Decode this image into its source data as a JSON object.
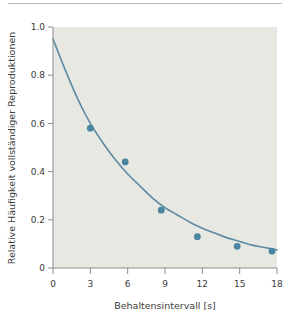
{
  "figure": {
    "name": "forgetting-curve-figure",
    "background_color": "#ffffff",
    "plot_background_color": "#e8e8e3",
    "accent_color": "#4a85a0",
    "curve_color": "#5c8ba3",
    "axis_color": "#8d8d8d",
    "text_color": "#3b3b3b"
  },
  "chart_data": {
    "type": "scatter",
    "title": "",
    "subtitle": "",
    "xlabel": "Behaltensintervall [s]",
    "ylabel": "Relative Häufigkeit vollständiger Reproduktionen",
    "xlim": [
      0,
      18
    ],
    "ylim": [
      0,
      1.0
    ],
    "xticks": [
      0,
      3,
      6,
      9,
      12,
      15,
      18
    ],
    "xtick_labels": [
      "0",
      "3",
      "6",
      "9",
      "12",
      "15",
      "18"
    ],
    "yticks": [
      0,
      0.2,
      0.4,
      0.6,
      0.8,
      1.0
    ],
    "ytick_labels": [
      "0",
      "0.2",
      "0.4",
      "0.6",
      "0.8",
      "1.0"
    ],
    "grid": false,
    "legend": null,
    "legend_position": "none",
    "series": [
      {
        "name": "Relative Häufigkeit vollständiger Reproduktionen",
        "marker": "circle",
        "marker_color": "#4a85a0",
        "x": [
          3,
          5.8,
          8.7,
          11.6,
          14.8,
          17.6
        ],
        "values": [
          0.58,
          0.44,
          0.24,
          0.13,
          0.09,
          0.07
        ]
      },
      {
        "name": "Fit-Kurve",
        "type": "line",
        "line_color": "#5c8ba3",
        "x": [
          0,
          1,
          2,
          3,
          4,
          5,
          6,
          7,
          8,
          9,
          10,
          11,
          12,
          13,
          14,
          15,
          16,
          17,
          18
        ],
        "values": [
          0.95,
          0.82,
          0.7,
          0.6,
          0.52,
          0.45,
          0.39,
          0.34,
          0.29,
          0.25,
          0.22,
          0.19,
          0.165,
          0.145,
          0.125,
          0.11,
          0.095,
          0.085,
          0.075
        ]
      }
    ],
    "annotations": []
  }
}
